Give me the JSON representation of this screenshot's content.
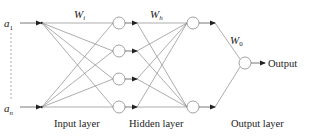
{
  "diagram": {
    "type": "neural-network",
    "inputs": {
      "first_label": "a",
      "first_sub": "1",
      "last_label": "a",
      "last_sub": "n"
    },
    "weights": {
      "input_to_hidden": {
        "base": "W",
        "sub": "i"
      },
      "hidden_to_hidden": {
        "base": "W",
        "sub": "h"
      },
      "hidden_to_output": {
        "base": "W",
        "sub": "0"
      }
    },
    "layers": {
      "input": "Input layer",
      "hidden": "Hidden layer",
      "output": "Output layer"
    },
    "output_label": "Output",
    "colors": {
      "edge": "#8a8a8a",
      "arrow": "#333333",
      "text": "#222222",
      "background": "#ffffff"
    }
  }
}
